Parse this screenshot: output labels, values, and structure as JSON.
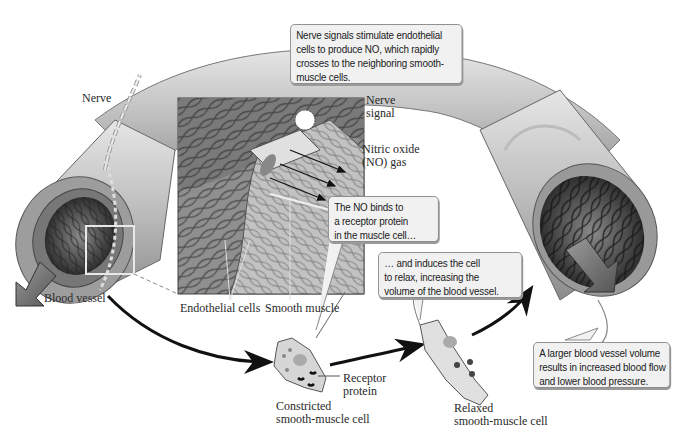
{
  "diagram": {
    "callouts": {
      "nerve_signals": [
        "Nerve signals stimulate endothelial",
        "cells to produce NO, which rapidly",
        "crosses to the neighboring smooth-",
        "muscle cells."
      ],
      "no_binds": [
        "The NO binds to",
        "a receptor protein",
        "in the muscle cell…"
      ],
      "induces_relax": [
        "… and induces the cell",
        "to relax, increasing the",
        "volume of the blood vessel."
      ],
      "larger_volume": [
        "A larger blood vessel volume",
        "results in increased blood flow",
        "and lower blood pressure."
      ]
    },
    "labels": {
      "nerve": "Nerve",
      "blood_vessel": "Blood vessel",
      "nerve_signal": [
        "Nerve",
        "signal"
      ],
      "nitric_oxide": [
        "Nitric oxide",
        "(NO) gas"
      ],
      "endothelial_cells": "Endothelial cells",
      "smooth_muscle": "Smooth muscle",
      "receptor_protein": [
        "Receptor",
        "protein"
      ],
      "constricted_cell": [
        "Constricted",
        "smooth-muscle cell"
      ],
      "relaxed_cell": [
        "Relaxed",
        "smooth-muscle cell"
      ]
    },
    "colors": {
      "vessel_outer": "#b9b9b9",
      "vessel_inner": "#3a3a3a",
      "callout_bg": "#f1f1f1",
      "arrow": "#111111",
      "cell_fill": "#d6d6d6"
    }
  }
}
